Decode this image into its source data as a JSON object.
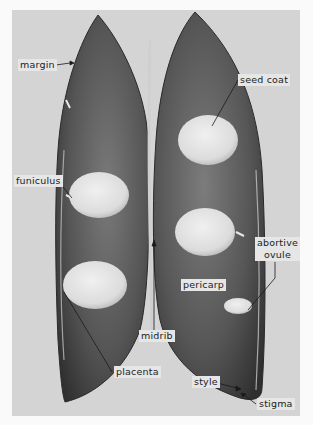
{
  "figure": {
    "labels": {
      "margin": "margin",
      "seed_coat": "seed coat",
      "funiculus": "funiculus",
      "abortive_ovule_line1": "abortive",
      "abortive_ovule_line2": "ovule",
      "pericarp": "pericarp",
      "midrib": "midrib",
      "placenta": "placenta",
      "style": "style",
      "stigma": "stigma"
    },
    "colors": {
      "background": "#d4d4d4",
      "pod_dark": "#3a3a3a",
      "pod_mid": "#6a6a6a",
      "seed": "#e2e2e2",
      "label_bg": "#e6e6e6"
    }
  }
}
